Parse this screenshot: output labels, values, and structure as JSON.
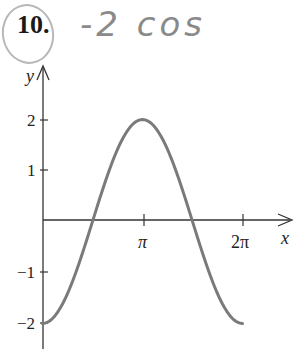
{
  "problem": {
    "number": "10.",
    "handwritten_note": "-2 cos"
  },
  "chart_data": {
    "type": "line",
    "title": "",
    "function": "y = -2cos(x)",
    "xlabel": "x",
    "ylabel": "y",
    "xlim": [
      0,
      6.6
    ],
    "ylim": [
      -2.3,
      2.5
    ],
    "x_ticks": [
      {
        "value": 3.14159,
        "label": "π"
      },
      {
        "value": 6.28318,
        "label": "2π"
      }
    ],
    "y_ticks": [
      {
        "value": 2,
        "label": "2"
      },
      {
        "value": 1,
        "label": "1"
      },
      {
        "value": -1,
        "label": "−1"
      },
      {
        "value": -2,
        "label": "−2"
      }
    ],
    "series": [
      {
        "name": "-2cos(x)",
        "x": [
          0,
          0.7854,
          1.5708,
          2.3562,
          3.1416,
          3.927,
          4.7124,
          5.4978,
          6.2832
        ],
        "y": [
          -2,
          -1.414,
          0,
          1.414,
          2,
          1.414,
          0,
          -1.414,
          -2
        ],
        "color": "#777777"
      }
    ],
    "grid": false,
    "legend": "none"
  },
  "axes": {
    "x_label": "x",
    "y_label": "y",
    "x_tick_labels": [
      "π",
      "2π"
    ],
    "y_tick_labels": [
      "2",
      "1",
      "−1",
      "−2"
    ]
  }
}
